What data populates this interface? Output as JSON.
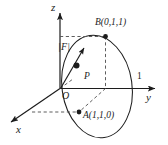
{
  "figure": {
    "background_color": "#ffffff",
    "line_color": "#1c1c1c",
    "dash_color": "#555555",
    "axes": {
      "z_label": "z",
      "y_label": "y",
      "x_label": "x",
      "origin_label": "O"
    },
    "ticks": {
      "y_tick_1": "1"
    },
    "points": [
      {
        "name": "point-b",
        "label": "B(0,1,1)",
        "marker": "filled-dot"
      },
      {
        "name": "point-a",
        "label": "A(1,1,0)",
        "marker": "filled-dot"
      },
      {
        "name": "point-p",
        "label": "P",
        "marker": "filled-dot"
      }
    ],
    "vector": {
      "label": "|F|"
    },
    "curve": {
      "name": "tilted-circle",
      "type": "ellipse"
    }
  }
}
